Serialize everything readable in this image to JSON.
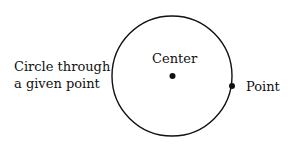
{
  "diagram": {
    "caption_line1": "Circle through",
    "caption_line2": "a given point",
    "center_label": "Center",
    "point_label": "Point",
    "colors": {
      "stroke": "#111111",
      "background": "#ffffff"
    }
  }
}
